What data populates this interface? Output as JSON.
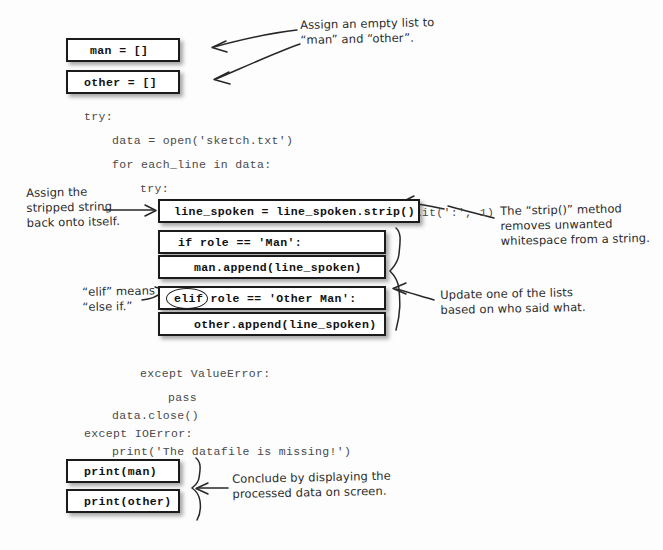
{
  "page": {
    "background": "#fdfdfd",
    "ink_color": "#272727",
    "box_border_color": "#1b1b1b"
  },
  "code_lines": [
    {
      "text": "try:",
      "x": 84,
      "y": 110
    },
    {
      "text": "data = open('sketch.txt')",
      "x": 112,
      "y": 134
    },
    {
      "text": "for each_line in data:",
      "x": 112,
      "y": 158
    },
    {
      "text": "try:",
      "x": 140,
      "y": 182
    },
    {
      "text": "(role, line_spoken) = each_line.split(':', 1)",
      "x": 168,
      "y": 206
    },
    {
      "text": "except ValueError:",
      "x": 140,
      "y": 367
    },
    {
      "text": "pass",
      "x": 168,
      "y": 391
    },
    {
      "text": "data.close()",
      "x": 112,
      "y": 409
    },
    {
      "text": "except IOError:",
      "x": 84,
      "y": 427
    },
    {
      "text": "print('The datafile is missing!')",
      "x": 112,
      "y": 445
    }
  ],
  "code_boxes": [
    {
      "name": "man-assign",
      "text": "man = []",
      "x": 66,
      "y": 38,
      "w": 114,
      "h": 24,
      "pad": 22
    },
    {
      "name": "other-assign",
      "text": "other = []",
      "x": 66,
      "y": 70,
      "w": 114,
      "h": 24,
      "pad": 16
    },
    {
      "name": "strip-call",
      "text": "line_spoken = line_spoken.strip()",
      "x": 158,
      "y": 199,
      "w": 262,
      "h": 24,
      "pad": 14
    },
    {
      "name": "if-man",
      "text": "if role == 'Man':",
      "x": 158,
      "y": 230,
      "w": 228,
      "h": 24,
      "pad": 18
    },
    {
      "name": "man-append",
      "text": "man.append(line_spoken)",
      "x": 158,
      "y": 255,
      "w": 228,
      "h": 24,
      "pad": 34
    },
    {
      "name": "elif-other-man",
      "text": "elif role == 'Other Man':",
      "x": 158,
      "y": 286,
      "w": 228,
      "h": 24,
      "pad": 14
    },
    {
      "name": "other-append",
      "text": "other.append(line_spoken)",
      "x": 158,
      "y": 312,
      "w": 228,
      "h": 24,
      "pad": 34
    },
    {
      "name": "print-man",
      "text": "print(man)",
      "x": 66,
      "y": 459,
      "w": 114,
      "h": 24,
      "pad": 16
    },
    {
      "name": "print-other",
      "text": "print(other)",
      "x": 66,
      "y": 489,
      "w": 114,
      "h": 24,
      "pad": 16
    }
  ],
  "keyword_circle": {
    "keyword": "elif",
    "x": 166,
    "y": 288,
    "w": 40,
    "h": 19
  },
  "annotations": [
    {
      "name": "assign-empty-list-note",
      "text": "Assign an empty list to\n“man” and “other”.",
      "x": 300,
      "y": 18
    },
    {
      "name": "stripped-string-note",
      "text": "Assign the\nstripped string\nback onto itself.",
      "x": 26,
      "y": 186
    },
    {
      "name": "strip-method-note",
      "text": "The “strip()” method\nremoves unwanted\nwhitespace from a string.",
      "x": 500,
      "y": 204
    },
    {
      "name": "elif-means-note",
      "text": "“elif” means\n“else if.”",
      "x": 82,
      "y": 285
    },
    {
      "name": "update-lists-note",
      "text": "Update one of the lists\nbased on who said what.",
      "x": 440,
      "y": 288
    },
    {
      "name": "conclude-display-note",
      "text": "Conclude by displaying the\nprocessed data on screen.",
      "x": 232,
      "y": 472
    }
  ]
}
